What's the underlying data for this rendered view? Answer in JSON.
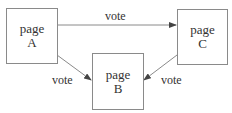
{
  "diagram": {
    "nodes": [
      {
        "id": "A",
        "line1": "page",
        "line2": "A"
      },
      {
        "id": "B",
        "line1": "page",
        "line2": "B"
      },
      {
        "id": "C",
        "line1": "page",
        "line2": "C"
      }
    ],
    "edges": [
      {
        "from": "A",
        "to": "C",
        "label": "vote"
      },
      {
        "from": "A",
        "to": "B",
        "label": "vote"
      },
      {
        "from": "C",
        "to": "B",
        "label": "vote"
      }
    ],
    "colors": {
      "stroke": "#8a8a8a",
      "arrow": "#555555",
      "text": "#333333"
    }
  }
}
